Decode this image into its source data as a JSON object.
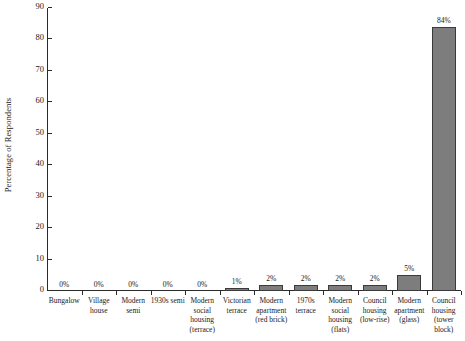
{
  "chart_data": {
    "type": "bar",
    "title": "",
    "xlabel": "",
    "ylabel": "Percentage of Respondents",
    "ylim": [
      0,
      90
    ],
    "ytick_labels": [
      "0",
      "10",
      "20",
      "30",
      "40",
      "50",
      "60",
      "70",
      "80",
      "90"
    ],
    "yticks": [
      0,
      10,
      20,
      30,
      40,
      50,
      60,
      70,
      80,
      90
    ],
    "grid": false,
    "legend": null,
    "categories": [
      "Bungalow",
      "Village house",
      "Modern semi",
      "1930s semi",
      "Modern social housing (terrace)",
      "Victorian terrace",
      "Modern apartment (red brick)",
      "1970s terrace",
      "Modern social housing (flats)",
      "Council housing (low-rise)",
      "Modern apartment (glass)",
      "Council housing (tower block)"
    ],
    "values": [
      0,
      0,
      0,
      0,
      0,
      1,
      2,
      2,
      2,
      2,
      5,
      84
    ],
    "data_labels": [
      "0%",
      "0%",
      "0%",
      "0%",
      "0%",
      "1%",
      "2%",
      "2%",
      "2%",
      "2%",
      "5%",
      "84%"
    ],
    "bar_color": "#7d7d7d",
    "bar_edge_color": "#3a3a3a",
    "axis_color": "#2b2b2b"
  }
}
